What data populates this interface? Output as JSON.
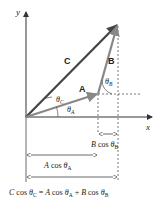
{
  "axes": {
    "x_label": "x",
    "y_label": "y"
  },
  "vectors": {
    "A": {
      "label": "A",
      "color": "#888888"
    },
    "B": {
      "label": "B",
      "color": "#888888"
    },
    "C": {
      "label": "C",
      "color": "#444444"
    }
  },
  "angles": {
    "theta_A": {
      "symbol": "θ",
      "sub": "A"
    },
    "theta_B": {
      "symbol": "θ",
      "sub": "B"
    },
    "theta_C": {
      "symbol": "θ",
      "sub": "C"
    }
  },
  "dimensions": {
    "b_cos": {
      "mag": "B",
      "fn": " cos ",
      "symbol": "θ",
      "sub": "B"
    },
    "a_cos": {
      "mag": "A",
      "fn": " cos ",
      "symbol": "θ",
      "sub": "A"
    }
  },
  "equation": {
    "lhs_mag": "C",
    "lhs_fn": " cos ",
    "lhs_theta": "θ",
    "lhs_sub": "C",
    "eq": " = ",
    "t1_mag": "A",
    "t1_fn": " cos ",
    "t1_theta": "θ",
    "t1_sub": "A",
    "plus": " + ",
    "t2_mag": "B",
    "t2_fn": " cos ",
    "t2_theta": "θ",
    "t2_sub": "B"
  }
}
